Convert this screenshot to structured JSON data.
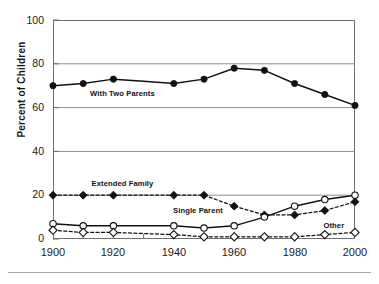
{
  "chart_data": {
    "type": "line",
    "title": "",
    "xlabel": "",
    "ylabel": "Percent of Children",
    "xlim": [
      1900,
      2000
    ],
    "ylim": [
      0,
      100
    ],
    "ytick_labels": [
      "0",
      "20",
      "40",
      "60",
      "80",
      "100"
    ],
    "ytick_values": [
      0,
      20,
      40,
      60,
      80,
      100
    ],
    "xtick_labels": [
      "1900",
      "1920",
      "1940",
      "1960",
      "1980",
      "2000"
    ],
    "xtick_values": [
      1900,
      1920,
      1940,
      1960,
      1980,
      2000
    ],
    "minor_xticks": [
      1910,
      1930,
      1950,
      1970,
      1990
    ],
    "grid": "horizontal",
    "legend": "inline-annotations",
    "x": [
      1900,
      1910,
      1920,
      1930,
      1940,
      1950,
      1960,
      1970,
      1980,
      1990,
      2000
    ],
    "series": [
      {
        "name": "With Two Parents",
        "marker": "filled-circle",
        "line": "solid",
        "values": [
          70,
          71,
          73,
          null,
          71,
          73,
          78,
          77,
          71,
          66,
          61
        ]
      },
      {
        "name": "Extended Family",
        "marker": "filled-diamond",
        "line": "dashed",
        "values": [
          20,
          20,
          20,
          null,
          20,
          20,
          15,
          11,
          11,
          13,
          17
        ]
      },
      {
        "name": "Single Parent",
        "marker": "open-circle",
        "line": "solid",
        "values": [
          7,
          6,
          6,
          null,
          6,
          5,
          6,
          10,
          15,
          18,
          20
        ]
      },
      {
        "name": "Other",
        "marker": "open-diamond",
        "line": "dashed",
        "values": [
          4,
          3,
          3,
          null,
          2,
          1,
          1,
          1,
          1,
          2,
          3
        ]
      }
    ],
    "annotations": [
      {
        "text": "With Two Parents",
        "x": 1923,
        "y": 66
      },
      {
        "text": "Extended Family",
        "x": 1923,
        "y": 25
      },
      {
        "text": "Single Parent",
        "x": 1948,
        "y": 13
      },
      {
        "text": "Other",
        "x": 1993,
        "y": 6
      }
    ]
  },
  "colors": {
    "line": "#111111",
    "grid": "#8c8c8c",
    "frame": "#6f6f6f",
    "text": "#1a1a1a",
    "marker_fill": "#111111",
    "marker_open": "#ffffff"
  }
}
